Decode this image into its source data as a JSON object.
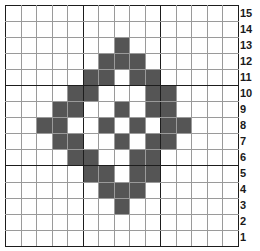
{
  "figure": {
    "name": "pixel-grid-diamond-pattern",
    "type": "pixel-grid",
    "columns": 15,
    "rows": 15,
    "fill_color": "#555555",
    "empty_color": "#ffffff",
    "minor_gridline_color": "#9a9a9a",
    "major_gridline_color": "#1d1d1d",
    "major_gridline_interval": 5
  },
  "row_labels": [
    "15",
    "14",
    "13",
    "12",
    "11",
    "10",
    "9",
    "8",
    "7",
    "6",
    "5",
    "4",
    "3",
    "2",
    "1"
  ],
  "chart_data": {
    "type": "heatmap",
    "title": "",
    "xlabel": "",
    "ylabel": "",
    "x": [
      1,
      2,
      3,
      4,
      5,
      6,
      7,
      8,
      9,
      10,
      11,
      12,
      13,
      14,
      15
    ],
    "categories": [
      "15",
      "14",
      "13",
      "12",
      "11",
      "10",
      "9",
      "8",
      "7",
      "6",
      "5",
      "4",
      "3",
      "2",
      "1"
    ],
    "legend": [],
    "grid": true,
    "values": [
      [
        0,
        0,
        0,
        0,
        0,
        0,
        0,
        0,
        0,
        0,
        0,
        0,
        0,
        0,
        0
      ],
      [
        0,
        0,
        0,
        0,
        0,
        0,
        0,
        0,
        0,
        0,
        0,
        0,
        0,
        0,
        0
      ],
      [
        0,
        0,
        0,
        0,
        0,
        0,
        0,
        1,
        0,
        0,
        0,
        0,
        0,
        0,
        0
      ],
      [
        0,
        0,
        0,
        0,
        0,
        0,
        1,
        1,
        1,
        0,
        0,
        0,
        0,
        0,
        0
      ],
      [
        0,
        0,
        0,
        0,
        0,
        1,
        1,
        0,
        1,
        1,
        0,
        0,
        0,
        0,
        0
      ],
      [
        0,
        0,
        0,
        0,
        1,
        1,
        0,
        0,
        0,
        1,
        1,
        0,
        0,
        0,
        0
      ],
      [
        0,
        0,
        0,
        1,
        1,
        0,
        0,
        1,
        0,
        1,
        1,
        0,
        0,
        0,
        0
      ],
      [
        0,
        0,
        1,
        1,
        0,
        0,
        1,
        0,
        1,
        0,
        1,
        1,
        0,
        0,
        0
      ],
      [
        0,
        0,
        0,
        1,
        1,
        0,
        0,
        1,
        0,
        1,
        1,
        0,
        0,
        0,
        0
      ],
      [
        0,
        0,
        0,
        0,
        1,
        1,
        0,
        0,
        1,
        1,
        0,
        0,
        0,
        0,
        0
      ],
      [
        0,
        0,
        0,
        0,
        0,
        1,
        1,
        0,
        1,
        1,
        0,
        0,
        0,
        0,
        0
      ],
      [
        0,
        0,
        0,
        0,
        0,
        0,
        1,
        1,
        1,
        0,
        0,
        0,
        0,
        0,
        0
      ],
      [
        0,
        0,
        0,
        0,
        0,
        0,
        0,
        1,
        0,
        0,
        0,
        0,
        0,
        0,
        0
      ],
      [
        0,
        0,
        0,
        0,
        0,
        0,
        0,
        0,
        0,
        0,
        0,
        0,
        0,
        0,
        0
      ],
      [
        0,
        0,
        0,
        0,
        0,
        0,
        0,
        0,
        0,
        0,
        0,
        0,
        0,
        0,
        0
      ]
    ]
  }
}
